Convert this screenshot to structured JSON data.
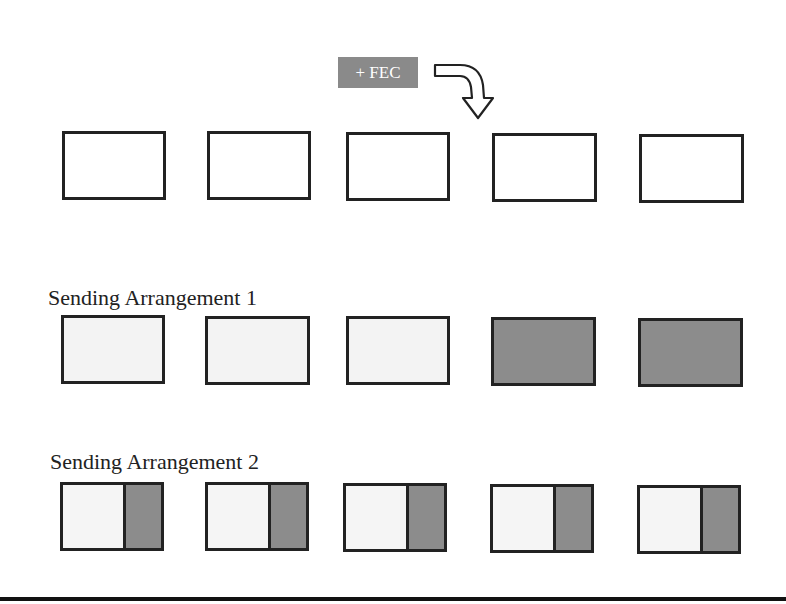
{
  "fec_label": "+ FEC",
  "colors": {
    "data": "#f3f3f3",
    "fec": "#8c8c8c",
    "outline": "#222222",
    "label_bg": "#8a8a8a"
  },
  "rows": [
    {
      "label": "",
      "boxes": [
        "empty",
        "empty",
        "empty",
        "empty",
        "empty"
      ]
    },
    {
      "label": "Sending Arrangement 1",
      "boxes": [
        "data",
        "data",
        "data",
        "fec",
        "fec"
      ]
    },
    {
      "label": "Sending Arrangement 2",
      "boxes": [
        "data+fec",
        "data+fec",
        "data+fec",
        "data+fec",
        "data+fec"
      ]
    }
  ],
  "row_labels": {
    "arrangement1": "Sending Arrangement 1",
    "arrangement2": "Sending Arrangement 2"
  }
}
